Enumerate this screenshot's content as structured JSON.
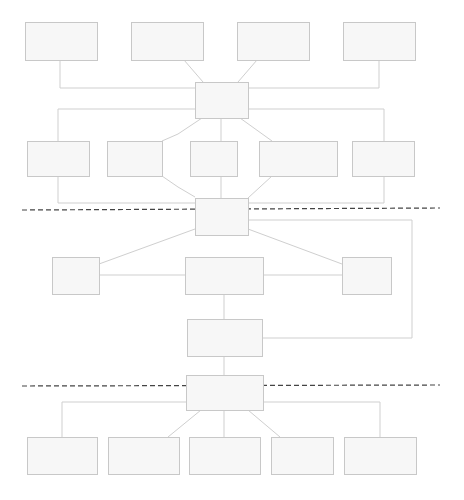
{
  "diagram": {
    "colors": {
      "node_fill": "#f7f7f7",
      "node_stroke": "#c8c8c8",
      "edge": "#cfcfcf",
      "divider": "#444444"
    },
    "nodes": [
      {
        "id": "top-1",
        "label": "",
        "x": 25,
        "y": 22,
        "w": 72,
        "h": 38
      },
      {
        "id": "top-2",
        "label": "",
        "x": 131,
        "y": 22,
        "w": 72,
        "h": 38
      },
      {
        "id": "top-3",
        "label": "",
        "x": 237,
        "y": 22,
        "w": 72,
        "h": 38
      },
      {
        "id": "top-4",
        "label": "",
        "x": 343,
        "y": 22,
        "w": 72,
        "h": 38
      },
      {
        "id": "hub-1",
        "label": "",
        "x": 195,
        "y": 82,
        "w": 53,
        "h": 36
      },
      {
        "id": "mid-1",
        "label": "",
        "x": 27,
        "y": 141,
        "w": 62,
        "h": 35
      },
      {
        "id": "mid-2",
        "label": "",
        "x": 107,
        "y": 141,
        "w": 55,
        "h": 35
      },
      {
        "id": "mid-3",
        "label": "",
        "x": 190,
        "y": 141,
        "w": 47,
        "h": 35
      },
      {
        "id": "mid-4",
        "label": "",
        "x": 259,
        "y": 141,
        "w": 78,
        "h": 35
      },
      {
        "id": "mid-5",
        "label": "",
        "x": 352,
        "y": 141,
        "w": 62,
        "h": 35
      },
      {
        "id": "hub-2",
        "label": "",
        "x": 195,
        "y": 198,
        "w": 53,
        "h": 37
      },
      {
        "id": "sec2-left",
        "label": "",
        "x": 52,
        "y": 257,
        "w": 47,
        "h": 37
      },
      {
        "id": "sec2-center",
        "label": "",
        "x": 185,
        "y": 257,
        "w": 78,
        "h": 37
      },
      {
        "id": "sec2-right",
        "label": "",
        "x": 342,
        "y": 257,
        "w": 49,
        "h": 37
      },
      {
        "id": "sec2-lower",
        "label": "",
        "x": 187,
        "y": 319,
        "w": 75,
        "h": 37
      },
      {
        "id": "hub-3",
        "label": "",
        "x": 186,
        "y": 375,
        "w": 77,
        "h": 35
      },
      {
        "id": "bot-1",
        "label": "",
        "x": 27,
        "y": 437,
        "w": 70,
        "h": 37
      },
      {
        "id": "bot-2",
        "label": "",
        "x": 108,
        "y": 437,
        "w": 71,
        "h": 37
      },
      {
        "id": "bot-3",
        "label": "",
        "x": 189,
        "y": 437,
        "w": 71,
        "h": 37
      },
      {
        "id": "bot-4",
        "label": "",
        "x": 271,
        "y": 437,
        "w": 62,
        "h": 37
      },
      {
        "id": "bot-5",
        "label": "",
        "x": 344,
        "y": 437,
        "w": 72,
        "h": 37
      }
    ],
    "edges": [
      {
        "id": "top1-hub1",
        "points": "60,60 60,88 195,88"
      },
      {
        "id": "top2-hub1",
        "points": "184,60 203,82"
      },
      {
        "id": "top3-hub1",
        "points": "257,60 238,82"
      },
      {
        "id": "top4-hub1",
        "points": "379,60 379,88 248,88"
      },
      {
        "id": "hub1-loop-left",
        "points": "195,109 58,109 58,141"
      },
      {
        "id": "hub1-loop-right",
        "points": "248,109 384,109 384,141"
      },
      {
        "id": "hub1-mid2",
        "points": "202,118 178,134 162,141"
      },
      {
        "id": "hub1-mid3",
        "points": "221,118 221,141"
      },
      {
        "id": "hub1-mid4",
        "points": "240,118 272,141"
      },
      {
        "id": "mid1-hub2",
        "points": "58,176 58,203 195,203"
      },
      {
        "id": "mid2-hub2",
        "points": "162,176 178,187 195,197"
      },
      {
        "id": "mid3-hub2",
        "points": "221,176 221,198"
      },
      {
        "id": "mid4-hub2",
        "points": "272,176 248,198"
      },
      {
        "id": "mid5-hub2",
        "points": "384,176 384,203 248,203"
      },
      {
        "id": "hub2-loop",
        "points": "248,220 412,220 412,338 262,338"
      },
      {
        "id": "hub2-left",
        "points": "195,229 99,264"
      },
      {
        "id": "hub2-right",
        "points": "248,229 342,264"
      },
      {
        "id": "left-center",
        "points": "99,275 185,275"
      },
      {
        "id": "center-right",
        "points": "263,275 342,275"
      },
      {
        "id": "center-lower",
        "points": "224,294 224,319"
      },
      {
        "id": "lower-hub3",
        "points": "224,356 224,375"
      },
      {
        "id": "hub3-bot1",
        "points": "186,402 62,402 62,437"
      },
      {
        "id": "hub3-bot2",
        "points": "201,410 168,437"
      },
      {
        "id": "hub3-bot3",
        "points": "224,410 224,437"
      },
      {
        "id": "hub3-bot4",
        "points": "248,410 280,437"
      },
      {
        "id": "hub3-bot5",
        "points": "263,402 380,402 380,437"
      }
    ],
    "dividers": [
      {
        "id": "divider-1",
        "x1": 22,
        "y1": 210,
        "x2": 440,
        "y2": 208
      },
      {
        "id": "divider-2",
        "x1": 22,
        "y1": 386,
        "x2": 440,
        "y2": 385
      }
    ],
    "caption": ""
  }
}
